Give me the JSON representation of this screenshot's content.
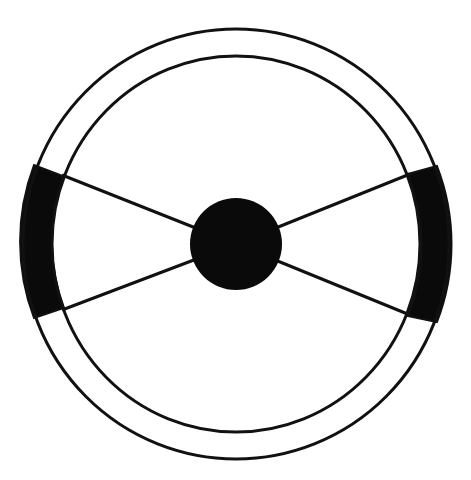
{
  "diagram": {
    "colors": {
      "stroke": "#111111",
      "fill": "#0a0a0a",
      "background": "#ffffff"
    },
    "center": {
      "cx": 236,
      "cy": 244
    },
    "outer_rim": {
      "rx": 213,
      "ry": 215,
      "stroke_width": 3
    },
    "inner_rim": {
      "rx": 184,
      "ry": 188,
      "stroke_width": 3
    },
    "hub": {
      "cx": 236,
      "cy": 244,
      "r": 46
    },
    "spokes": [
      {
        "name": "upper-left",
        "x1": 62,
        "y1": 175,
        "x2": 236,
        "y2": 244
      },
      {
        "name": "lower-left",
        "x1": 62,
        "y1": 310,
        "x2": 236,
        "y2": 244
      },
      {
        "name": "upper-right",
        "x1": 410,
        "y1": 174,
        "x2": 236,
        "y2": 244
      },
      {
        "name": "lower-right",
        "x1": 410,
        "y1": 315,
        "x2": 236,
        "y2": 244
      }
    ],
    "grips": [
      {
        "name": "left-grip",
        "top": [
          [
            34,
            165
          ],
          [
            63,
            176
          ]
        ],
        "bottom": [
          [
            34,
            318
          ],
          [
            64,
            308
          ]
        ]
      },
      {
        "name": "right-grip",
        "top": [
          [
            408,
            174
          ],
          [
            437,
            166
          ]
        ],
        "bottom": [
          [
            408,
            316
          ],
          [
            437,
            322
          ]
        ]
      }
    ]
  }
}
